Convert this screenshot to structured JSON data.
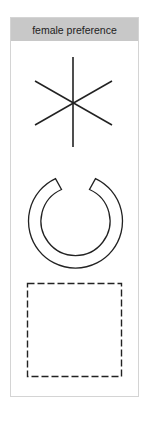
{
  "panel": {
    "title": "female preference",
    "header_color": "#c8c8c8",
    "border_color": "#d4d4d4",
    "stroke_color": "#222222"
  },
  "shapes": [
    {
      "name": "asterisk",
      "kind": "six-spoke-star",
      "style": "solid"
    },
    {
      "name": "broken-ring",
      "kind": "open-annulus",
      "style": "solid outline",
      "gap": "top"
    },
    {
      "name": "square",
      "kind": "square",
      "style": "dashed"
    }
  ]
}
